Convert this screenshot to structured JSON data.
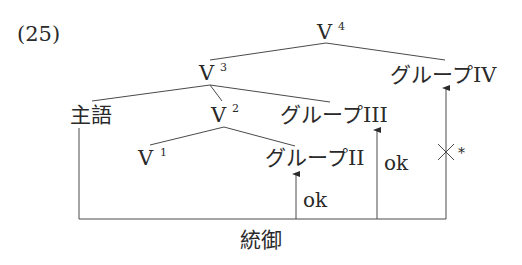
{
  "example_number": "(25)",
  "nodes": {
    "v4": {
      "base": "V",
      "sup": "4"
    },
    "v3": {
      "base": "V",
      "sup": "3"
    },
    "v2": {
      "base": "V",
      "sup": "2"
    },
    "v1": {
      "base": "V",
      "sup": "1"
    },
    "subject": "主語",
    "group2": "グループII",
    "group3": "グループIII",
    "group4": "グループIV"
  },
  "arrows": [
    {
      "target": "group2",
      "label": "ok",
      "status": "ok"
    },
    {
      "target": "group3",
      "label": "ok",
      "status": "ok"
    },
    {
      "target": "group4",
      "label": "×*",
      "status": "blocked"
    }
  ],
  "blocked_mark": "×",
  "blocked_star": "*",
  "bottom_label": "統御",
  "colors": {
    "line": "#4a4a4a",
    "text": "#2a2a2a",
    "background": "#ffffff"
  }
}
